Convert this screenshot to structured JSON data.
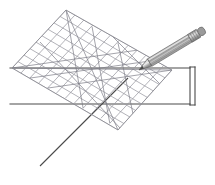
{
  "figure": {
    "canvas": {
      "width": 215,
      "height": 185,
      "background": "#ffffff"
    },
    "colors": {
      "grid_line": "#9a9aa2",
      "grid_line_dark": "#6f6f78",
      "outline": "#3a3a3a",
      "rule_line": "#4a4a4a",
      "pencil_body_light": "#cfcfcf",
      "pencil_body_mid": "#9a9a9a",
      "pencil_body_dark": "#6a6a6a",
      "pencil_tip": "#4a4a4a",
      "pencil_ferrule": "#a8a8a8",
      "pencil_eraser": "#8f8f8f"
    },
    "set_square": {
      "label": "gridded-set-square",
      "shape": "rotated-square",
      "corners": [
        {
          "name": "left",
          "x": 12,
          "y": 68
        },
        {
          "name": "top",
          "x": 66,
          "y": 10
        },
        {
          "name": "right",
          "x": 172,
          "y": 70
        },
        {
          "name": "bottom",
          "x": 118,
          "y": 130
        }
      ],
      "grid_divisions": 9,
      "has_diagonals": true
    },
    "straightedge": {
      "label": "straightedge-rectangle",
      "top_line_y": 68,
      "bottom_line_y": 104,
      "left_x": 10,
      "right_x": 190,
      "double_edge_offset": 5
    },
    "guide_line": {
      "label": "construction-guide-line",
      "x1": 40,
      "y1": 166,
      "x2": 128,
      "y2": 78
    },
    "pencil": {
      "label": "pencil",
      "tip": {
        "x": 139,
        "y": 70
      },
      "eraser_end": {
        "x": 205,
        "y": 30
      },
      "angle_degrees": -31,
      "length": 78,
      "width": 9,
      "parts": [
        "tip",
        "wood",
        "body",
        "ferrule",
        "eraser"
      ]
    }
  }
}
